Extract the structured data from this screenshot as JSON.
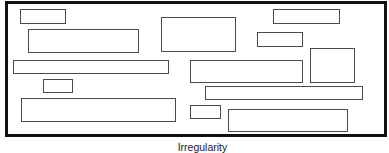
{
  "diagram": {
    "caption": "Irregularity",
    "frame": {
      "x": 5,
      "y": 1,
      "width": 382,
      "height": 136,
      "border_color": "#111111"
    },
    "box_border_color": "#4a4a4a",
    "boxes": [
      {
        "x": 20,
        "y": 9,
        "w": 46,
        "h": 15
      },
      {
        "x": 28,
        "y": 29,
        "w": 111,
        "h": 24
      },
      {
        "x": 161,
        "y": 17,
        "w": 75,
        "h": 35
      },
      {
        "x": 273,
        "y": 9,
        "w": 67,
        "h": 15
      },
      {
        "x": 257,
        "y": 32,
        "w": 46,
        "h": 15
      },
      {
        "x": 310,
        "y": 48,
        "w": 45,
        "h": 35
      },
      {
        "x": 13,
        "y": 60,
        "w": 156,
        "h": 14
      },
      {
        "x": 190,
        "y": 60,
        "w": 113,
        "h": 23
      },
      {
        "x": 43,
        "y": 79,
        "w": 30,
        "h": 14
      },
      {
        "x": 205,
        "y": 86,
        "w": 158,
        "h": 14
      },
      {
        "x": 21,
        "y": 98,
        "w": 155,
        "h": 24
      },
      {
        "x": 190,
        "y": 105,
        "w": 31,
        "h": 14
      },
      {
        "x": 228,
        "y": 109,
        "w": 120,
        "h": 23
      }
    ]
  }
}
